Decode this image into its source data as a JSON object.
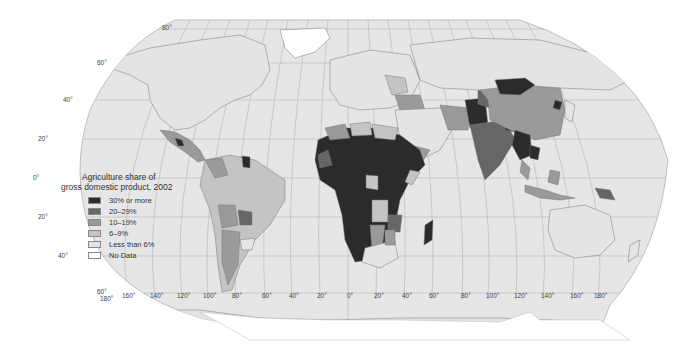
{
  "map": {
    "title_line1": "Agriculture share of",
    "title_line2": "gross domestic product, 2002",
    "legend": [
      {
        "label": "30% or more",
        "color": "#2b2b2b"
      },
      {
        "label": "20–29%",
        "color": "#666666"
      },
      {
        "label": "10–19%",
        "color": "#9a9a9a"
      },
      {
        "label": "6–9%",
        "color": "#c4c4c4"
      },
      {
        "label": "Less than 6%",
        "color": "#e4e4e4"
      },
      {
        "label": "No Data",
        "color": "#ffffff"
      }
    ],
    "ocean_color": "#e6e6e6",
    "latitude_labels": [
      {
        "label": "80°",
        "x": 162,
        "y": 30
      },
      {
        "label": "60°",
        "x": 97,
        "y": 65
      },
      {
        "label": "40°",
        "x": 63,
        "y": 102
      },
      {
        "label": "20°",
        "x": 38,
        "y": 141
      },
      {
        "label": "0°",
        "x": 33,
        "y": 180
      },
      {
        "label": "20°",
        "x": 38,
        "y": 219
      },
      {
        "label": "40°",
        "x": 58,
        "y": 258
      },
      {
        "label": "60°",
        "x": 97,
        "y": 294
      }
    ],
    "longitude_labels": [
      {
        "label": "180°",
        "x": 100,
        "y": 301
      },
      {
        "label": "160°",
        "x": 122,
        "y": 298
      },
      {
        "label": "140°",
        "x": 150,
        "y": 298
      },
      {
        "label": "120°",
        "x": 177,
        "y": 298
      },
      {
        "label": "100°",
        "x": 203,
        "y": 298
      },
      {
        "label": "80°",
        "x": 232,
        "y": 298
      },
      {
        "label": "60°",
        "x": 262,
        "y": 298
      },
      {
        "label": "40°",
        "x": 289,
        "y": 298
      },
      {
        "label": "20°",
        "x": 317,
        "y": 298
      },
      {
        "label": "0°",
        "x": 347,
        "y": 298
      },
      {
        "label": "20°",
        "x": 374,
        "y": 298
      },
      {
        "label": "40°",
        "x": 402,
        "y": 298
      },
      {
        "label": "60°",
        "x": 429,
        "y": 298
      },
      {
        "label": "80°",
        "x": 461,
        "y": 298
      },
      {
        "label": "100°",
        "x": 486,
        "y": 298
      },
      {
        "label": "120°",
        "x": 514,
        "y": 298
      },
      {
        "label": "140°",
        "x": 541,
        "y": 298
      },
      {
        "label": "160°",
        "x": 570,
        "y": 298
      },
      {
        "label": "180°",
        "x": 594,
        "y": 298
      }
    ]
  }
}
